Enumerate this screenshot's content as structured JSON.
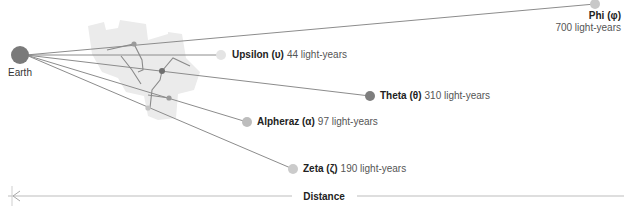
{
  "colors": {
    "background": "#ffffff",
    "earth": "#7a7a7a",
    "silhouette": "#ebebeb",
    "sight_line": "#8c8c8c",
    "constellation_line": "#8a8a8a",
    "axis": "#bdbdbd",
    "text": "#222222",
    "text_secondary": "#555555"
  },
  "origin": {
    "label": "Earth",
    "x": 20,
    "y": 55,
    "r": 9
  },
  "stars": [
    {
      "id": "upsilon",
      "name": "Upsilon (υ)",
      "distance": "44 light-years",
      "distance_ly": 44,
      "x": 221,
      "y": 55,
      "r": 5,
      "color": "#e4e4e4",
      "label_x": 232,
      "label_y": 58,
      "anchor": "start"
    },
    {
      "id": "alpheraz",
      "name": "Alpheraz (α)",
      "distance": "97 light-years",
      "distance_ly": 97,
      "x": 247,
      "y": 122,
      "r": 5,
      "color": "#bdbdbd",
      "label_x": 257,
      "label_y": 125,
      "anchor": "start"
    },
    {
      "id": "zeta",
      "name": "Zeta (ζ)",
      "distance": "190 light-years",
      "distance_ly": 190,
      "x": 293,
      "y": 169,
      "r": 5,
      "color": "#cbcbcb",
      "label_x": 303,
      "label_y": 172,
      "anchor": "start"
    },
    {
      "id": "theta",
      "name": "Theta (θ)",
      "distance": "310 light-years",
      "distance_ly": 310,
      "x": 370,
      "y": 96,
      "r": 5,
      "color": "#7e7e7e",
      "label_x": 380,
      "label_y": 99,
      "anchor": "start"
    },
    {
      "id": "phi",
      "name": "Phi (φ)",
      "distance": "700 light-years",
      "distance_ly": 700,
      "x": 595,
      "y": 4,
      "r": 5,
      "color": "#c8c8c8",
      "label_x": 621,
      "label_y": 19,
      "anchor": "end",
      "stacked": true
    }
  ],
  "constellation": {
    "silhouette_points": "88,26 104,22 106,30 118,28 120,20 146,24 148,40 168,34 168,32 182,34 186,58 200,72 194,90 178,94 176,118 158,120 148,116 144,96 126,92 118,78 102,72 92,54",
    "points": [
      {
        "x": 134,
        "y": 44,
        "color": "#9a9a9a",
        "r": 2.6
      },
      {
        "x": 162,
        "y": 71,
        "color": "#6f6f6f",
        "r": 3.0
      },
      {
        "x": 169,
        "y": 98,
        "color": "#9a9a9a",
        "r": 2.6
      },
      {
        "x": 148,
        "y": 108,
        "color": "#c4c4c4",
        "r": 2.6
      }
    ],
    "lines": [
      "M107,50 L134,44 L142,60 L143,70 L138,72",
      "M121,56 L132,70 L141,84",
      "M162,71 L173,58 L190,66",
      "M162,71 L160,80 L152,90 L150,108",
      "M148,95 L169,98"
    ]
  },
  "axis": {
    "label": "Distance",
    "y": 196,
    "x_start": 8,
    "x_end": 624,
    "label_x": 324,
    "gap_left": 292,
    "gap_right": 357
  }
}
